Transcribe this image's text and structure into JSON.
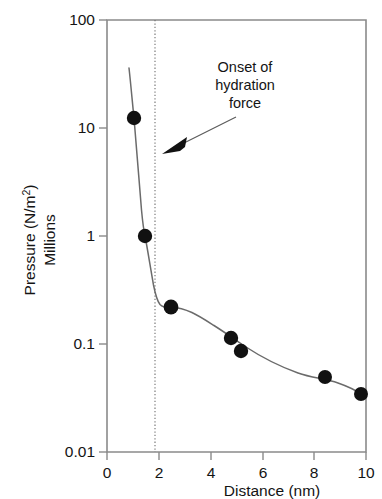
{
  "chart_data": {
    "type": "scatter",
    "title": "",
    "xlabel": "Distance (nm)",
    "ylabel_line1": "Pressure (N/m²)",
    "ylabel_line2": "Millions",
    "yscale": "log",
    "xscale": "linear",
    "xlim": [
      0,
      10
    ],
    "ylim": [
      0.01,
      100
    ],
    "grid": false,
    "legend": null,
    "xticks": [
      "0",
      "2",
      "4",
      "6",
      "8",
      "10"
    ],
    "xtick_values": [
      0,
      2,
      4,
      6,
      8,
      10
    ],
    "yticks": [
      "100",
      "10",
      "1",
      "0.1",
      "0.01"
    ],
    "ytick_values": [
      100,
      10,
      1,
      0.1,
      0.01
    ],
    "points": [
      {
        "x": 1.05,
        "y": 11.0
      },
      {
        "x": 1.45,
        "y": 0.98
      },
      {
        "x": 2.45,
        "y": 0.205
      },
      {
        "x": 4.75,
        "y": 0.103
      },
      {
        "x": 5.15,
        "y": 0.082
      },
      {
        "x": 8.35,
        "y": 0.049
      },
      {
        "x": 9.75,
        "y": 0.035
      }
    ],
    "fit_curve": [
      {
        "x": 0.8,
        "y": 30.0
      },
      {
        "x": 0.95,
        "y": 17.0
      },
      {
        "x": 1.1,
        "y": 9.0
      },
      {
        "x": 1.25,
        "y": 4.0
      },
      {
        "x": 1.4,
        "y": 1.25
      },
      {
        "x": 1.55,
        "y": 0.62
      },
      {
        "x": 1.72,
        "y": 0.4
      },
      {
        "x": 1.9,
        "y": 0.305
      },
      {
        "x": 2.1,
        "y": 0.255
      },
      {
        "x": 2.45,
        "y": 0.205
      },
      {
        "x": 3.0,
        "y": 0.163
      },
      {
        "x": 3.6,
        "y": 0.135
      },
      {
        "x": 4.3,
        "y": 0.112
      },
      {
        "x": 5.1,
        "y": 0.093
      },
      {
        "x": 6.0,
        "y": 0.078
      },
      {
        "x": 7.0,
        "y": 0.065
      },
      {
        "x": 8.35,
        "y": 0.05
      },
      {
        "x": 9.75,
        "y": 0.035
      }
    ],
    "annotations": [
      {
        "name": "onset-of-hydration-force",
        "lines": [
          "Onset of",
          "hydration",
          "force"
        ],
        "points_to_x": 2.1,
        "points_to_y": 5.0
      }
    ],
    "reference_lines": [
      {
        "name": "onset-marker",
        "orientation": "vertical",
        "x": 2.1,
        "style": "dotted"
      }
    ],
    "colors": {
      "point": "#111111",
      "curve": "#6b6b6b",
      "axis": "#8a8a8a",
      "text": "#141414",
      "background": "#ffffff"
    }
  }
}
